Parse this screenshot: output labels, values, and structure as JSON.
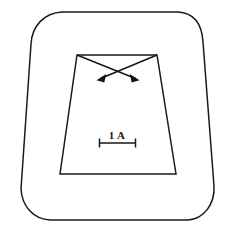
{
  "figure": {
    "caption": "",
    "background_color": "#ffffff",
    "line_color": "#1a1a1a",
    "width": 235,
    "height": 232
  },
  "scale_bar": {
    "label": "1 A",
    "label_x": 117,
    "label_y": 138,
    "bar_y": 143,
    "bar_x_start": 99,
    "bar_x_end": 136,
    "tick_height": 9,
    "length_px": 37
  },
  "outer_shape": {
    "name": "rounded-trapezoid-outline",
    "description": "rounded-corner trapezoid outer boundary",
    "corner_radius": 30,
    "top_left": [
      60,
      12
    ],
    "top_right": [
      180,
      12
    ],
    "bottom_right": [
      190,
      220
    ],
    "bottom_left": [
      48,
      220
    ]
  },
  "inner_shape": {
    "name": "inner-trapezoid",
    "description": "sharp-corner trapezoid inner boundary",
    "top_left": [
      77,
      55
    ],
    "top_right": [
      157,
      55
    ],
    "bottom_right": [
      176,
      174
    ],
    "bottom_left": [
      60,
      174
    ]
  },
  "arrows": [
    {
      "name": "arrow-left",
      "description": "arrow from inner trapezoid top-right corner pointing down-left",
      "start": [
        157,
        55
      ],
      "end": [
        97,
        80
      ]
    },
    {
      "name": "arrow-right",
      "description": "arrow from inner trapezoid top-left corner pointing down-right",
      "start": [
        77,
        55
      ],
      "end": [
        139,
        80
      ]
    }
  ],
  "arrow_crossing_point": [
    117,
    69
  ]
}
